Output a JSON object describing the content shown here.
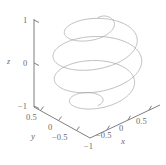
{
  "figure": {
    "background_color": "#ffffff",
    "curve_color": "#9a9a9a",
    "axis_color": "#6f6f6f",
    "text_color": "#6b6b6b"
  },
  "axes": {
    "z": {
      "title": "z",
      "ticks": [
        "1",
        "0",
        "−1"
      ],
      "values": [
        1,
        0,
        -1
      ]
    },
    "y": {
      "title": "y",
      "ticks": [
        "0.5",
        "0",
        "−0.5",
        "−1"
      ],
      "values": [
        0.5,
        0,
        -0.5,
        -1
      ]
    },
    "x": {
      "title": "x",
      "ticks": [
        "−1",
        "−0.5",
        "0",
        "0.5"
      ],
      "values": [
        -1,
        -0.5,
        0,
        0.5
      ]
    }
  },
  "chart_data": {
    "type": "line",
    "plot_kind": "3d-parametric-curve",
    "title": "",
    "subtitle": "",
    "xlabel": "x",
    "ylabel": "y",
    "zlabel": "z",
    "xlim": [
      -1,
      1
    ],
    "ylim": [
      -1,
      1
    ],
    "zlim": [
      -1,
      1
    ],
    "xticks": [
      -1,
      -0.5,
      0,
      0.5
    ],
    "yticks": [
      0.5,
      0,
      -0.5,
      -1
    ],
    "zticks": [
      1,
      0,
      -1
    ],
    "grid": false,
    "legend": null,
    "legend_position": "none",
    "annotations": [],
    "series": [
      {
        "name": "helix",
        "color": "#9a9a9a",
        "line_width": 0.6,
        "description": "Barrel-shaped helix: radius widest near z=0, tapering toward z=+1 and z=-1; about 4 turns.",
        "parametric": {
          "t_range": [
            -1,
            1
          ],
          "turns": 4,
          "x": "r(t)*cos(4*pi*t)",
          "y": "r(t)*sin(4*pi*t)",
          "z": "t",
          "r": "sqrt(max(0, 1 - t*t))*0.97 + 0.03"
        },
        "points": [
          {
            "t": -1.0,
            "x": 0.03,
            "y": 0.0,
            "z": -1.0
          },
          {
            "t": -0.95,
            "x": 0.227,
            "y": -0.216,
            "z": -0.95
          },
          {
            "t": -0.9,
            "x": -0.073,
            "y": -0.437,
            "z": -0.9
          },
          {
            "t": -0.85,
            "x": -0.479,
            "y": -0.185,
            "z": -0.85
          },
          {
            "t": -0.8,
            "x": -0.407,
            "y": 0.379,
            "z": -0.8
          },
          {
            "t": -0.75,
            "x": 0.081,
            "y": 0.654,
            "z": -0.75
          },
          {
            "t": -0.7,
            "x": 0.577,
            "y": 0.396,
            "z": -0.7
          },
          {
            "t": -0.65,
            "x": 0.714,
            "y": -0.216,
            "z": -0.65
          },
          {
            "t": -0.6,
            "x": 0.38,
            "y": -0.712,
            "z": -0.6
          },
          {
            "t": -0.55,
            "x": -0.217,
            "y": -0.799,
            "z": -0.55
          },
          {
            "t": -0.5,
            "x": -0.712,
            "y": -0.436,
            "z": -0.5
          },
          {
            "t": -0.45,
            "x": -0.851,
            "y": 0.152,
            "z": -0.45
          },
          {
            "t": -0.4,
            "x": -0.541,
            "y": 0.7,
            "z": -0.4
          },
          {
            "t": -0.35,
            "x": 0.052,
            "y": 0.911,
            "z": -0.35
          },
          {
            "t": -0.3,
            "x": 0.64,
            "y": 0.671,
            "z": -0.3
          },
          {
            "t": -0.25,
            "x": 0.922,
            "y": 0.096,
            "z": -0.25
          },
          {
            "t": -0.2,
            "x": 0.76,
            "y": -0.571,
            "z": -0.2
          },
          {
            "t": -0.15,
            "x": 0.222,
            "y": -0.953,
            "z": -0.15
          },
          {
            "t": -0.1,
            "x": -0.424,
            "y": -0.872,
            "z": -0.1
          },
          {
            "t": -0.05,
            "x": -0.869,
            "y": -0.411,
            "z": -0.05
          },
          {
            "t": 0.0,
            "x": -1.0,
            "y": 0.0,
            "z": 0.0
          },
          {
            "t": 0.05,
            "x": -0.869,
            "y": 0.411,
            "z": 0.05
          },
          {
            "t": 0.1,
            "x": -0.424,
            "y": 0.872,
            "z": 0.1
          },
          {
            "t": 0.15,
            "x": 0.222,
            "y": 0.953,
            "z": 0.15
          },
          {
            "t": 0.2,
            "x": 0.76,
            "y": 0.571,
            "z": 0.2
          },
          {
            "t": 0.25,
            "x": 0.922,
            "y": -0.096,
            "z": 0.25
          },
          {
            "t": 0.3,
            "x": 0.64,
            "y": -0.671,
            "z": 0.3
          },
          {
            "t": 0.35,
            "x": 0.052,
            "y": -0.911,
            "z": 0.35
          },
          {
            "t": 0.4,
            "x": -0.541,
            "y": -0.7,
            "z": 0.4
          },
          {
            "t": 0.45,
            "x": -0.851,
            "y": -0.152,
            "z": 0.45
          },
          {
            "t": 0.5,
            "x": -0.712,
            "y": 0.436,
            "z": 0.5
          },
          {
            "t": 0.55,
            "x": -0.217,
            "y": 0.799,
            "z": 0.55
          },
          {
            "t": 0.6,
            "x": 0.38,
            "y": 0.712,
            "z": 0.6
          },
          {
            "t": 0.65,
            "x": 0.714,
            "y": 0.216,
            "z": 0.65
          },
          {
            "t": 0.7,
            "x": 0.577,
            "y": -0.396,
            "z": 0.7
          },
          {
            "t": 0.75,
            "x": 0.081,
            "y": -0.654,
            "z": 0.75
          },
          {
            "t": 0.8,
            "x": -0.407,
            "y": -0.379,
            "z": 0.8
          },
          {
            "t": 0.85,
            "x": -0.479,
            "y": 0.185,
            "z": 0.85
          },
          {
            "t": 0.9,
            "x": -0.073,
            "y": 0.437,
            "z": 0.9
          },
          {
            "t": 0.95,
            "x": 0.227,
            "y": 0.216,
            "z": 0.95
          },
          {
            "t": 1.0,
            "x": 0.03,
            "y": 0.0,
            "z": 1.0
          }
        ]
      }
    ]
  }
}
